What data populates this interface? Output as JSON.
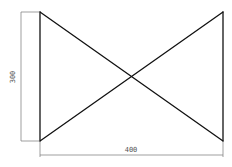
{
  "drawing": {
    "shape": "bowtie",
    "width_value": 400,
    "height_value": 300,
    "colors": {
      "outline": "#111111",
      "dimension": "#777777",
      "background": "#ffffff"
    }
  },
  "dimensions": {
    "horizontal_label": "400",
    "vertical_label": "300"
  }
}
